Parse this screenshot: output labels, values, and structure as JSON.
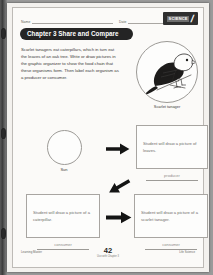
{
  "header": {
    "name_label": "Name",
    "date_label": "Date",
    "logo_text": "SCIENCE",
    "logo_slash": "/"
  },
  "chapter": {
    "title": "Chapter 3  Share and Compare"
  },
  "intro": {
    "text": "Scarlet tanagers eat caterpillars, which in turn eat the leaves of an oak tree. Write or draw pictures in the graphic organizer to show the food chain that these organisms form. Then label each organism as a producer or consumer."
  },
  "figure": {
    "caption": "Scarlet tanager",
    "icon": "scarlet-tanager-illustration"
  },
  "organizer": {
    "sun_label": "Sun",
    "boxes": [
      {
        "id": "leaves",
        "text": "Student will draw a picture of leaves."
      },
      {
        "id": "caterpillar",
        "text": "Student will draw a picture of a caterpillar."
      },
      {
        "id": "tanager",
        "text": "Student will draw a picture of a scarlet tanager."
      }
    ],
    "answers": [
      {
        "id": "producer",
        "word": "producer"
      },
      {
        "id": "consumer1",
        "word": "consumer"
      },
      {
        "id": "consumer2",
        "word": "consumer"
      }
    ],
    "arrow_icon": "arrow-right-icon"
  },
  "footer": {
    "left": "Learning Master",
    "page_number": "42",
    "sub": "Use with Chapter 3",
    "right": "Life Science"
  },
  "colors": {
    "banner": "#242424",
    "paper": "#fbfaf8",
    "rule": "#9c9a96",
    "answer_text": "#6f6d6a"
  }
}
